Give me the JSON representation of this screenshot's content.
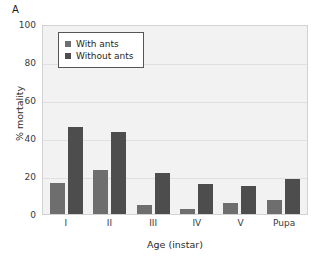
{
  "panel": {
    "label": "A"
  },
  "chart_data": {
    "type": "bar",
    "title": "",
    "subtitle": "",
    "xlabel": "Age (instar)",
    "ylabel": "% mortality",
    "categories": [
      "I",
      "II",
      "III",
      "IV",
      "V",
      "Pupa"
    ],
    "series": [
      {
        "name": "With ants",
        "color": "#6e6e6e",
        "values": [
          16.5,
          23,
          4.5,
          2.5,
          6,
          7.5
        ]
      },
      {
        "name": "Without ants",
        "color": "#4d4d4d",
        "values": [
          46,
          43,
          21.5,
          16,
          15,
          18.5
        ]
      }
    ],
    "ylim": [
      0,
      100
    ],
    "yticks": [
      100,
      80,
      60,
      40,
      20,
      0
    ],
    "grid": true,
    "legend_position": "upper-left-inside",
    "plot_background": "#f2f2f2",
    "gridline_color": "#e0e0e0"
  }
}
